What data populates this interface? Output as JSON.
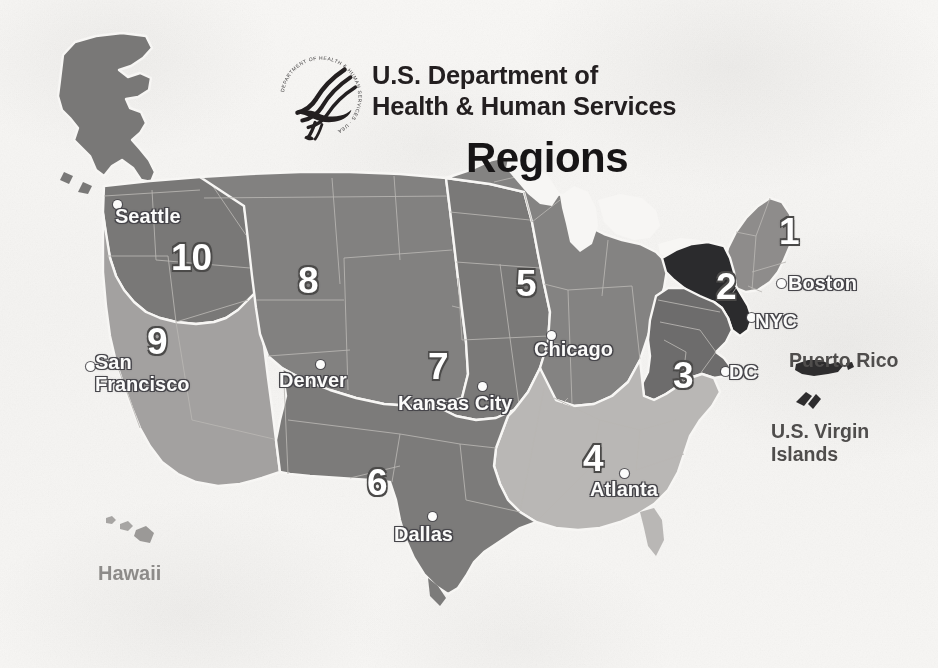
{
  "document": {
    "kind": "scanned-map-figure",
    "title": "HHS Regions"
  },
  "header": {
    "logo_icon": "hhs-eagle-seal-icon",
    "logo_ring_text": "DEPARTMENT OF HEALTH & HUMAN SERVICES · USA",
    "agency_line_1": "U.S. Department of",
    "agency_line_2": "Health & Human Services",
    "map_title": "Regions"
  },
  "map": {
    "background_color": "#f6f5f3",
    "border_color": "#f7f6f4",
    "state_line_color": "#b8b6b3",
    "regions": [
      {
        "number": "1",
        "name": "Region 1",
        "office": "Boston",
        "fill": "#8e8c8b",
        "label_x": 779,
        "label_y": 213
      },
      {
        "number": "2",
        "name": "Region 2",
        "office": "NYC",
        "fill": "#2b2b2d",
        "label_x": 716,
        "label_y": 268
      },
      {
        "number": "3",
        "name": "Region 3",
        "office": "DC",
        "fill": "#6d6c6c",
        "label_x": 673,
        "label_y": 357
      },
      {
        "number": "4",
        "name": "Region 4",
        "office": "Atlanta",
        "fill": "#b9b7b5",
        "label_x": 583,
        "label_y": 440
      },
      {
        "number": "5",
        "name": "Region 5",
        "office": "Chicago",
        "fill": "#848382",
        "label_x": 516,
        "label_y": 265
      },
      {
        "number": "6",
        "name": "Region 6",
        "office": "Dallas",
        "fill": "#7c7b7a",
        "label_x": 367,
        "label_y": 464
      },
      {
        "number": "7",
        "name": "Region 7",
        "office": "Kansas City",
        "fill": "#7a7978",
        "label_x": 428,
        "label_y": 348
      },
      {
        "number": "8",
        "name": "Region 8",
        "office": "Denver",
        "fill": "#828180",
        "label_x": 298,
        "label_y": 262
      },
      {
        "number": "9",
        "name": "Region 9",
        "office": "San Francisco",
        "fill": "#a3a1a0",
        "label_x": 147,
        "label_y": 323
      },
      {
        "number": "10",
        "name": "Region 10",
        "office": "Seattle",
        "fill": "#797877",
        "label_x": 171,
        "label_y": 239
      }
    ],
    "cities": [
      {
        "label": "Seattle",
        "lines": [
          "Seattle"
        ],
        "dot_x": 113,
        "dot_y": 200,
        "text_x": 115,
        "text_y": 205
      },
      {
        "label": "San Francisco",
        "lines": [
          "San",
          "Francisco"
        ],
        "dot_x": 86,
        "dot_y": 362,
        "text_x": 95,
        "text_y": 352
      },
      {
        "label": "Denver",
        "lines": [
          "Denver"
        ],
        "dot_x": 316,
        "dot_y": 360,
        "text_x": 279,
        "text_y": 369
      },
      {
        "label": "Kansas City",
        "lines": [
          "Kansas City"
        ],
        "dot_x": 478,
        "dot_y": 382,
        "text_x": 398,
        "text_y": 392
      },
      {
        "label": "Dallas",
        "lines": [
          "Dallas"
        ],
        "dot_x": 428,
        "dot_y": 512,
        "text_x": 394,
        "text_y": 523
      },
      {
        "label": "Chicago",
        "lines": [
          "Chicago"
        ],
        "dot_x": 547,
        "dot_y": 331,
        "text_x": 534,
        "text_y": 338
      },
      {
        "label": "Atlanta",
        "lines": [
          "Atlanta"
        ],
        "dot_x": 620,
        "dot_y": 469,
        "text_x": 590,
        "text_y": 478
      },
      {
        "label": "Boston",
        "lines": [
          "Boston"
        ],
        "dot_x": 777,
        "dot_y": 279,
        "text_x": 788,
        "text_y": 272
      },
      {
        "label": "NYC",
        "lines": [
          "NYC"
        ],
        "dot_x": 747,
        "dot_y": 313,
        "text_x": 755,
        "text_y": 310
      },
      {
        "label": "DC",
        "lines": [
          "DC"
        ],
        "dot_x": 721,
        "dot_y": 367,
        "text_x": 729,
        "text_y": 361
      }
    ],
    "territories": [
      {
        "label_lines": [
          "Puerto Rico"
        ],
        "text_x": 789,
        "text_y": 349,
        "icon": "puerto-rico-island-icon"
      },
      {
        "label_lines": [
          "U.S. Virgin",
          "Islands"
        ],
        "text_x": 771,
        "text_y": 420,
        "icon": "us-virgin-islands-icon"
      }
    ],
    "hawaii": {
      "label": "Hawaii",
      "text_x": 98,
      "text_y": 562,
      "icon": "hawaii-islands-icon"
    },
    "alaska": {
      "label": "",
      "icon": "alaska-shape-icon"
    }
  }
}
